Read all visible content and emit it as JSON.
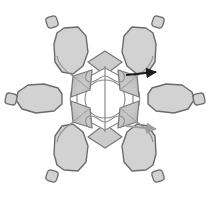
{
  "figure": {
    "title": "",
    "background_color": "#ffffff",
    "symmetry": "six-fold radial",
    "center": {
      "x": 105,
      "y": 99
    }
  },
  "palette": {
    "lobe_fill": "#d2d2d2",
    "lobe_stroke": "#6b6b6b",
    "cap_fill": "#d2d2d2",
    "cap_stroke": "#6b6b6b",
    "petal_fill": "#c3c3c3",
    "petal_stroke": "#787878",
    "petal_hatch": "#9a9a9a",
    "diamond_fill": "#cccccc",
    "diamond_stroke": "#7a7a7a",
    "core_stroke": "#8a8a8a",
    "loop_stroke": "#909090",
    "arrow_dark": "#1c1c1c",
    "arrow_light": "#9e9e9e"
  },
  "lobes": [
    {
      "name": "lobe-upper-left",
      "angle_deg": 120,
      "outline": "64,28 78,27 86,36 88,52 83,66 73,74 62,72 55,62 54,44 57,33",
      "cap": {
        "cx": 52,
        "cy": 22,
        "r": 5.5,
        "rot": -18
      }
    },
    {
      "name": "lobe-upper-right",
      "angle_deg": 60,
      "outline": "146,28 132,27 124,36 122,52 127,66 137,74 148,72 155,62 156,44 153,33",
      "cap": {
        "cx": 158,
        "cy": 22,
        "r": 5.5,
        "rot": 18
      }
    },
    {
      "name": "lobe-left",
      "angle_deg": 180,
      "outline": "58,88 44,84 28,85 18,92 16,100 22,109 36,113 54,111 62,104 62,94",
      "cap": {
        "cx": 11,
        "cy": 99,
        "r": 5.5,
        "rot": 12
      }
    },
    {
      "name": "lobe-right",
      "angle_deg": 0,
      "outline": "152,88 166,84 182,85 192,92 194,100 188,109 174,113 156,111 148,104 148,94",
      "cap": {
        "cx": 199,
        "cy": 99,
        "r": 5.5,
        "rot": -12
      }
    },
    {
      "name": "lobe-lower-left",
      "angle_deg": 240,
      "outline": "64,170 78,171 86,162 88,146 83,132 73,124 62,126 55,136 54,154 57,165",
      "cap": {
        "cx": 52,
        "cy": 176,
        "r": 5.5,
        "rot": 18
      }
    },
    {
      "name": "lobe-lower-right",
      "angle_deg": 300,
      "outline": "146,170 132,171 124,162 122,146 127,132 137,124 148,126 155,136 156,154 153,165",
      "cap": {
        "cx": 158,
        "cy": 176,
        "r": 5.5,
        "rot": -18
      }
    }
  ],
  "petals": [
    {
      "name": "petal-upper-left",
      "outline": "73,76 92,70 90,90 71,97",
      "hatch_from": "73,76",
      "hatch_to": "90,90"
    },
    {
      "name": "petal-upper-right",
      "outline": "137,76 118,70 120,90 139,97",
      "hatch_from": "137,76",
      "hatch_to": "120,90"
    },
    {
      "name": "petal-lower-left",
      "outline": "73,122 92,128 90,108 71,101",
      "hatch_from": "73,122",
      "hatch_to": "90,108"
    },
    {
      "name": "petal-lower-right",
      "outline": "137,122 118,128 120,108 139,101",
      "hatch_from": "137,122",
      "hatch_to": "120,108"
    }
  ],
  "diamonds": [
    {
      "name": "diamond-top",
      "outline": "105,51 122,62 105,75 88,62"
    },
    {
      "name": "diamond-bottom",
      "outline": "105,148 122,137 105,124 88,137"
    }
  ],
  "core": {
    "name": "central-hexagon-core",
    "hexagon": "105,68 133,83 133,115 105,130 77,115 77,83",
    "inner_ring": "M105,80 C116,80 125,88 125,99 C125,110 116,118 105,118 C94,118 85,110 85,99 C85,88 94,80 105,80 Z",
    "axis_line": {
      "x1": 105,
      "y1": 66,
      "x2": 105,
      "y2": 132
    }
  },
  "loops": [
    {
      "name": "loop-top-bowtie",
      "path": "M90,70 C84,74 84,82 91,82 C97,82 100,76 105,76 C110,76 113,82 119,82 C126,82 126,74 120,70"
    },
    {
      "name": "loop-bottom-bowtie",
      "path": "M90,128 C84,124 84,116 91,116 C97,116 100,122 105,122 C110,122 113,116 119,116 C126,116 126,124 120,128"
    },
    {
      "name": "loop-left-arc",
      "path": "M77,83 C68,90 68,108 77,115"
    },
    {
      "name": "loop-right-arc",
      "path": "M133,83 C142,90 142,108 133,115"
    }
  ],
  "arrows": [
    {
      "name": "arrow-upper-right",
      "style": "dark",
      "color": "#1c1c1c",
      "x1": 126,
      "y1": 75,
      "x2": 156,
      "y2": 72,
      "label": ""
    },
    {
      "name": "arrow-lower-right",
      "style": "light",
      "color": "#9e9e9e",
      "x1": 126,
      "y1": 126,
      "x2": 156,
      "y2": 129,
      "label": ""
    }
  ],
  "tendrils": [
    {
      "name": "tendril-upper-left",
      "path": "M73,76 C64,70 58,64 57,56"
    },
    {
      "name": "tendril-upper-right",
      "path": "M137,76 C146,70 152,64 153,56"
    },
    {
      "name": "tendril-lower-left",
      "path": "M73,122 C64,128 58,134 57,142"
    },
    {
      "name": "tendril-lower-right",
      "path": "M137,122 C146,128 152,134 153,142"
    }
  ]
}
